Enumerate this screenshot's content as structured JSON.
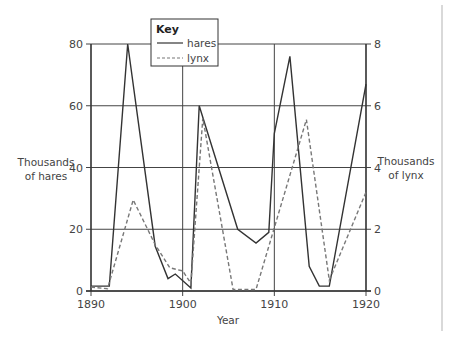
{
  "chart_data": {
    "type": "line",
    "title": "",
    "xlabel": "Year",
    "ylabel_left": "Thousands of hares",
    "ylabel_left_lines": [
      "Thousands",
      "of hares"
    ],
    "ylabel_right": "Thousands of lynx",
    "ylabel_right_lines": [
      "Thousands",
      "of lynx"
    ],
    "xlim": [
      1890,
      1920
    ],
    "ylim_left": [
      0,
      80
    ],
    "ylim_right": [
      0,
      8
    ],
    "x_ticks": [
      1890,
      1900,
      1910,
      1920
    ],
    "y_ticks_left": [
      0,
      20,
      40,
      60,
      80
    ],
    "y_ticks_right": [
      0,
      2,
      4,
      6,
      8
    ],
    "grid": true,
    "legend": {
      "title": "Key",
      "position": "top-center",
      "entries": [
        {
          "label": "hares",
          "style": "solid"
        },
        {
          "label": "lynx",
          "style": "dashed"
        }
      ]
    },
    "series": [
      {
        "name": "hares",
        "axis": "left",
        "style": "solid",
        "color": "#333333",
        "points": [
          [
            1890,
            1.6
          ],
          [
            1892,
            1.6
          ],
          [
            1894,
            80
          ],
          [
            1897,
            14.5
          ],
          [
            1898.4,
            4
          ],
          [
            1899.2,
            5.5
          ],
          [
            1900.9,
            1
          ],
          [
            1901.8,
            60
          ],
          [
            1906,
            20
          ],
          [
            1908,
            15.5
          ],
          [
            1909.4,
            19
          ],
          [
            1910,
            51
          ],
          [
            1911.7,
            76
          ],
          [
            1913.8,
            8
          ],
          [
            1914.9,
            1.6
          ],
          [
            1916,
            1.6
          ],
          [
            1920,
            67
          ]
        ]
      },
      {
        "name": "lynx",
        "axis": "right",
        "style": "dashed",
        "color": "#777777",
        "points": [
          [
            1890,
            0.13
          ],
          [
            1891.8,
            0.07
          ],
          [
            1894.6,
            2.95
          ],
          [
            1897,
            1.5
          ],
          [
            1898.6,
            0.75
          ],
          [
            1900,
            0.65
          ],
          [
            1900.9,
            0.25
          ],
          [
            1902.2,
            5.6
          ],
          [
            1905.5,
            0.05
          ],
          [
            1908,
            0.05
          ],
          [
            1913.5,
            5.55
          ],
          [
            1916,
            0.35
          ],
          [
            1920,
            3.2
          ]
        ]
      }
    ]
  }
}
